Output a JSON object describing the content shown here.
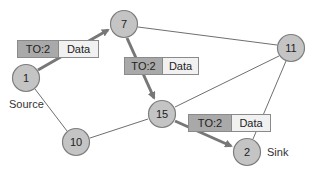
{
  "nodes": [
    {
      "id": "1",
      "label": "1",
      "x": 26,
      "y": 78
    },
    {
      "id": "7",
      "label": "7",
      "x": 124,
      "y": 24
    },
    {
      "id": "11",
      "label": "11",
      "x": 291,
      "y": 48
    },
    {
      "id": "15",
      "label": "15",
      "x": 162,
      "y": 114
    },
    {
      "id": "10",
      "label": "10",
      "x": 76,
      "y": 142
    },
    {
      "id": "2",
      "label": "2",
      "x": 247,
      "y": 152
    }
  ],
  "edges": [
    {
      "from": "1",
      "to": "7",
      "highlighted": true
    },
    {
      "from": "7",
      "to": "15",
      "highlighted": true
    },
    {
      "from": "15",
      "to": "2",
      "highlighted": true
    },
    {
      "from": "7",
      "to": "11",
      "highlighted": false
    },
    {
      "from": "1",
      "to": "10",
      "highlighted": false
    },
    {
      "from": "10",
      "to": "15",
      "highlighted": false
    },
    {
      "from": "15",
      "to": "11",
      "highlighted": false
    },
    {
      "from": "11",
      "to": "2",
      "highlighted": false
    }
  ],
  "packets": [
    {
      "header": "TO:2",
      "payload": "Data"
    },
    {
      "header": "TO:2",
      "payload": "Data"
    },
    {
      "header": "TO:2",
      "payload": "Data"
    }
  ],
  "labels": {
    "source": "Source",
    "sink": "Sink"
  }
}
